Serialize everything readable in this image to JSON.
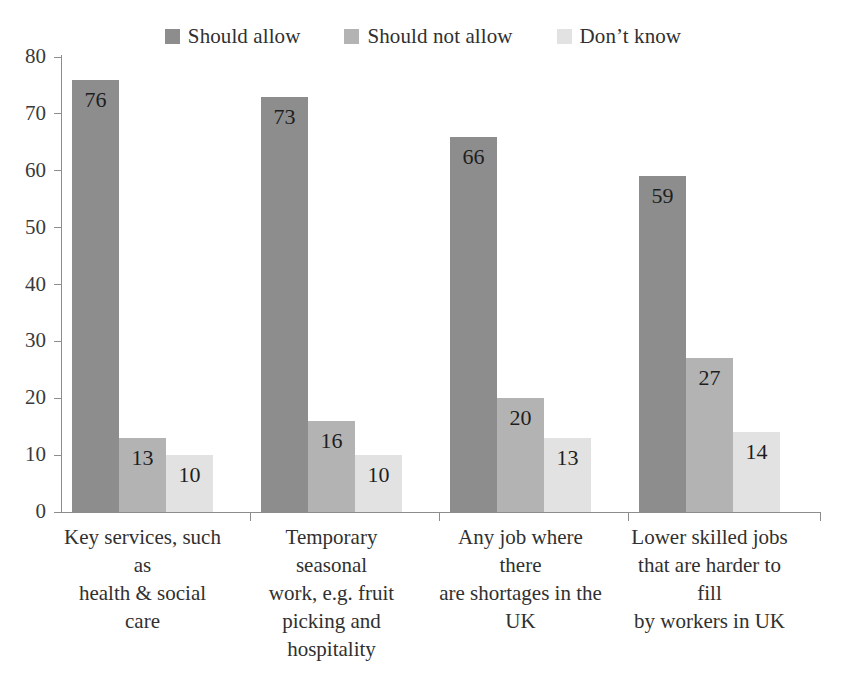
{
  "chart_data": {
    "type": "bar",
    "title": "",
    "subtitle": "",
    "xlabel": "",
    "ylabel": "",
    "ylim": [
      0,
      80
    ],
    "ytick_step": 10,
    "yticks": [
      80,
      70,
      60,
      50,
      40,
      30,
      20,
      10,
      0
    ],
    "grid": false,
    "legend_position": "top-center",
    "orientation": "vertical",
    "group_mode": "clustered",
    "categories": [
      "Key services, such as health & social care",
      "Temporary seasonal work, e.g. fruit picking and hospitality",
      "Any job where there are shortages in the UK",
      "Lower skilled jobs that are harder to fill by workers in UK"
    ],
    "category_lines": [
      [
        "Key services, such as",
        "health & social care"
      ],
      [
        "Temporary seasonal",
        "work, e.g. fruit",
        "picking and",
        "hospitality"
      ],
      [
        "Any job where there",
        "are shortages in the",
        "UK"
      ],
      [
        "Lower skilled jobs",
        "that are harder to fill",
        "by workers in UK"
      ]
    ],
    "series": [
      {
        "name": "Should allow",
        "color": "#8d8d8d",
        "values": [
          76,
          73,
          66,
          59
        ]
      },
      {
        "name": "Should not allow",
        "color": "#b3b3b3",
        "values": [
          13,
          16,
          20,
          27
        ]
      },
      {
        "name": "Don’t know",
        "color": "#e2e2e2",
        "values": [
          10,
          10,
          13,
          14
        ]
      }
    ]
  },
  "legend": {
    "items": [
      {
        "label": "Should allow",
        "color": "#8d8d8d"
      },
      {
        "label": "Should not allow",
        "color": "#b3b3b3"
      },
      {
        "label": "Don’t know",
        "color": "#e2e2e2"
      }
    ]
  },
  "axis": {
    "y_tick_labels": [
      "80",
      "70",
      "60",
      "50",
      "40",
      "30",
      "20",
      "10",
      "0"
    ],
    "axis_color": "#8d8d8d"
  }
}
